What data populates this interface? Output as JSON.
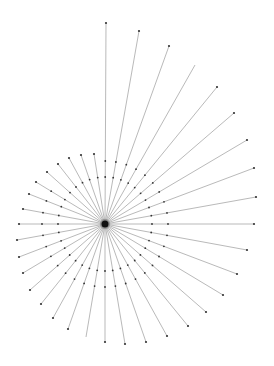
{
  "diagram": {
    "type": "radial-spoke-graph",
    "center": {
      "x": 105,
      "y": 224
    },
    "colors": {
      "background": "#ffffff",
      "edge": "#8a8a8a",
      "node": "#333333",
      "hub": "#111111"
    },
    "inner_ring_radius": 47,
    "spokes": [
      {
        "x": 106,
        "y": 23,
        "end_dot": true
      },
      {
        "x": 139,
        "y": 31,
        "end_dot": true
      },
      {
        "x": 169,
        "y": 46,
        "end_dot": true
      },
      {
        "x": 195,
        "y": 65,
        "end_dot": false
      },
      {
        "x": 217,
        "y": 87,
        "end_dot": true
      },
      {
        "x": 234,
        "y": 113,
        "end_dot": true
      },
      {
        "x": 247,
        "y": 140,
        "end_dot": true
      },
      {
        "x": 254,
        "y": 168,
        "end_dot": true
      },
      {
        "x": 256,
        "y": 197,
        "end_dot": true
      },
      {
        "x": 254,
        "y": 224,
        "end_dot": true
      },
      {
        "x": 247,
        "y": 250,
        "end_dot": true
      },
      {
        "x": 237,
        "y": 274,
        "end_dot": true
      },
      {
        "x": 223,
        "y": 295,
        "end_dot": true
      },
      {
        "x": 206,
        "y": 312,
        "end_dot": true
      },
      {
        "x": 188,
        "y": 326,
        "end_dot": true
      },
      {
        "x": 167,
        "y": 336,
        "end_dot": true
      },
      {
        "x": 146,
        "y": 342,
        "end_dot": true
      },
      {
        "x": 125,
        "y": 344,
        "end_dot": true
      },
      {
        "x": 105,
        "y": 342,
        "end_dot": true
      },
      {
        "x": 86,
        "y": 337,
        "end_dot": false
      },
      {
        "x": 68,
        "y": 329,
        "end_dot": true
      },
      {
        "x": 53,
        "y": 318,
        "end_dot": true
      },
      {
        "x": 41,
        "y": 304,
        "end_dot": true
      },
      {
        "x": 30,
        "y": 290,
        "end_dot": true
      },
      {
        "x": 23,
        "y": 273,
        "end_dot": true
      },
      {
        "x": 19,
        "y": 257,
        "end_dot": true
      },
      {
        "x": 17,
        "y": 240,
        "end_dot": true
      },
      {
        "x": 19,
        "y": 224,
        "end_dot": true
      },
      {
        "x": 23,
        "y": 209,
        "end_dot": true
      },
      {
        "x": 29,
        "y": 194,
        "end_dot": true
      },
      {
        "x": 36,
        "y": 182,
        "end_dot": true
      },
      {
        "x": 47,
        "y": 172,
        "end_dot": true
      },
      {
        "x": 58,
        "y": 164,
        "end_dot": true
      },
      {
        "x": 69,
        "y": 158,
        "end_dot": true
      },
      {
        "x": 81,
        "y": 155,
        "end_dot": true
      },
      {
        "x": 94,
        "y": 154,
        "end_dot": true
      }
    ]
  }
}
